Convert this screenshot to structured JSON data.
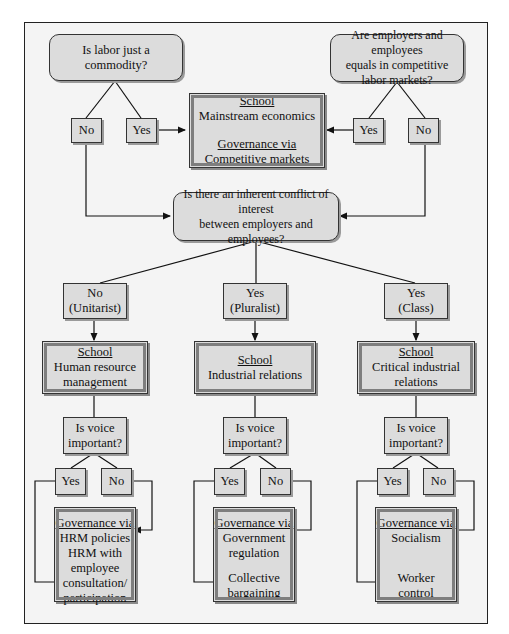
{
  "diagram": {
    "top_left_question": {
      "line1": "Is labor just a",
      "line2": "commodity?"
    },
    "top_right_question": {
      "line1": "Are employers and employees",
      "line2": "equals in competitive",
      "line3": "labor markets?"
    },
    "top_left_answers": {
      "no": "No",
      "yes": "Yes"
    },
    "top_right_answers": {
      "yes": "Yes",
      "no": "No"
    },
    "mainstream": {
      "school_label": "School",
      "school_name": "Mainstream economics",
      "governance_label": "Governance via",
      "governance_value": "Competitive markets"
    },
    "central_question": {
      "line1": "Is there an inherent conflict of interest",
      "line2": "between employers and employees?"
    },
    "branches": [
      {
        "answer": "No",
        "answer_sub": "(Unitarist)",
        "school_label": "School",
        "school_line1": "Human resource",
        "school_line2": "management",
        "voice_q1": "Is voice",
        "voice_q2": "important?",
        "yes": "Yes",
        "no": "No",
        "gov_label": "Governance via",
        "gov_no_1": "HRM policies",
        "gov_no_2": "",
        "gov_yes_1": "HRM with",
        "gov_yes_2": "employee",
        "gov_yes_3": "consultation/",
        "gov_yes_4": "participation"
      },
      {
        "answer": "Yes",
        "answer_sub": "(Pluralist)",
        "school_label": "School",
        "school_line1": "Industrial relations",
        "school_line2": "",
        "voice_q1": "Is voice",
        "voice_q2": "important?",
        "yes": "Yes",
        "no": "No",
        "gov_label": "Governance via",
        "gov_no_1": "Government",
        "gov_no_2": "regulation",
        "gov_yes_1": "Collective",
        "gov_yes_2": "bargaining",
        "gov_yes_3": "",
        "gov_yes_4": ""
      },
      {
        "answer": "Yes",
        "answer_sub": "(Class)",
        "school_label": "School",
        "school_line1": "Critical industrial",
        "school_line2": "relations",
        "voice_q1": "Is voice",
        "voice_q2": "important?",
        "yes": "Yes",
        "no": "No",
        "gov_label": "Governance via",
        "gov_no_1": "Socialism",
        "gov_no_2": "",
        "gov_yes_1": "Worker",
        "gov_yes_2": "control",
        "gov_yes_3": "",
        "gov_yes_4": ""
      }
    ]
  },
  "colors": {
    "box_fill": "#dcdcdc",
    "frame_fill": "#f4f4f4",
    "line": "#111111",
    "school_border": "#7e7e7e"
  }
}
